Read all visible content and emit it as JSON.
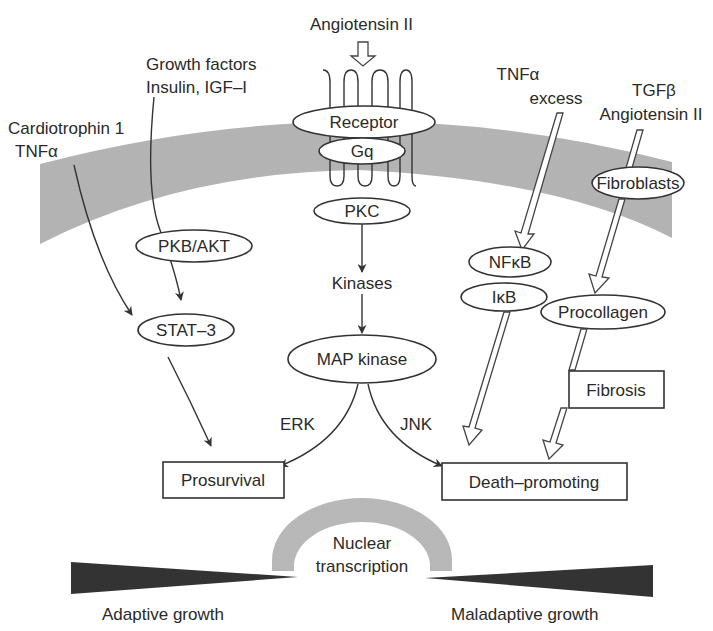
{
  "figure": {
    "colors": {
      "membrane": "#b3b3b3",
      "nucleus_arch": "#b8b8b8",
      "wedge": "#333333",
      "stroke": "#333333",
      "text": "#2a2a2a"
    }
  },
  "inputs": {
    "cardiotrophin": {
      "line1": "Cardiotrophin 1",
      "line2": "TNFα"
    },
    "growth_factors": {
      "line1": "Growth factors",
      "line2": "Insulin, IGF–I"
    },
    "angiotensin": {
      "label": "Angiotensin II"
    },
    "tnf_excess": {
      "line1": "TNFα",
      "line2": "excess"
    },
    "tgf": {
      "line1": "TGFβ",
      "line2": "Angiotensin II"
    }
  },
  "nodes": {
    "receptor": "Receptor",
    "gq": "Gq",
    "pkc": "PKC",
    "kinases": "Kinases",
    "map_kinase": "MAP kinase",
    "pkb_akt": "PKB/AKT",
    "stat3": "STAT–3",
    "nfkb": "NFκB",
    "ikb": "IκB",
    "fibroblasts": "Fibroblasts",
    "procollagen": "Procollagen",
    "fibrosis": "Fibrosis"
  },
  "branches": {
    "erk": "ERK",
    "jnk": "JNK"
  },
  "outcomes": {
    "prosurvival": "Prosurvival",
    "death_promoting": "Death–promoting"
  },
  "nucleus": {
    "line1": "Nuclear",
    "line2": "transcription"
  },
  "growth": {
    "adaptive": "Adaptive growth",
    "maladaptive": "Maladaptive growth"
  }
}
